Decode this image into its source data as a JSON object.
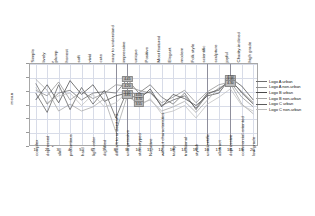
{
  "chart_data": {
    "type": "line",
    "title": "",
    "xlabel": "",
    "ylabel": "mean",
    "ylim": [
      2,
      5
    ],
    "yticks": [
      "2",
      "2.5",
      "3",
      "3.5",
      "4",
      "4.5",
      "5"
    ],
    "grid": true,
    "legend_position": "right",
    "categories": [
      "Simple",
      "lively",
      "plump",
      "honest",
      "soft",
      "vivid",
      "cute",
      "easy to understand",
      "impressive",
      "unique",
      "Positive",
      "Most featured",
      "Elegant",
      "modern",
      "Folk style",
      "scientific",
      "sculpture",
      "joyful",
      "Charity-inclined",
      "high grade"
    ],
    "bottom_categories": [
      "complex",
      "depressed",
      "slim",
      "pretentious",
      "hard",
      "light color",
      "dignified",
      "difficult to understand",
      "unimpressive",
      "stereotyped",
      "Negative",
      "without characteristics",
      "tacky",
      "traditional",
      "stylish",
      "unscientific",
      "abstract",
      "depressive",
      "commercial-oriented",
      "low grade"
    ],
    "bottom_indices": [
      "1",
      "2",
      "3",
      "4",
      "5",
      "6",
      "7",
      "8",
      "9",
      "10",
      "11",
      "12",
      "13",
      "14",
      "15",
      "16",
      "17",
      "18",
      "19",
      "20"
    ],
    "series": [
      {
        "name": "Logo A urban",
        "color": "#6e6e6e",
        "values": [
          4.3,
          3.55,
          3.95,
          4.05,
          3.7,
          3.95,
          4.0,
          3.95,
          4.45,
          3.95,
          4.25,
          3.8,
          3.55,
          3.95,
          3.35,
          3.9,
          4.1,
          4.4,
          4.0,
          3.6
        ]
      },
      {
        "name": "Logo A non-urban",
        "color": "#8f8f8f",
        "values": [
          4.05,
          3.85,
          4.35,
          3.7,
          4.0,
          3.75,
          3.95,
          4.25,
          4.2,
          4.05,
          3.95,
          3.6,
          3.8,
          4.05,
          3.6,
          4.0,
          4.25,
          4.35,
          3.8,
          3.45
        ]
      },
      {
        "name": "Logo B urban",
        "color": "#4a4a4a",
        "values": [
          3.7,
          4.25,
          3.6,
          4.4,
          3.9,
          4.25,
          3.65,
          3.85,
          3.95,
          3.7,
          4.1,
          3.45,
          3.9,
          3.75,
          3.5,
          3.85,
          3.95,
          4.5,
          4.2,
          3.7
        ]
      },
      {
        "name": "Logo B non-urban",
        "color": "#a6a6a6",
        "values": [
          4.45,
          4.05,
          3.3,
          3.55,
          3.3,
          3.45,
          3.75,
          2.55,
          3.85,
          3.55,
          3.7,
          3.3,
          3.45,
          3.65,
          3.25,
          3.7,
          4.15,
          4.3,
          3.55,
          3.2
        ]
      },
      {
        "name": "Logo C urban",
        "color": "#5c5c5c",
        "values": [
          3.95,
          3.25,
          4.25,
          3.35,
          4.15,
          3.55,
          4.05,
          3.05,
          4.05,
          3.85,
          4.0,
          3.5,
          3.7,
          3.85,
          3.4,
          3.95,
          4.05,
          4.45,
          3.95,
          3.55
        ]
      },
      {
        "name": "Logo C non-urban",
        "color": "#bdbdbd",
        "values": [
          4.15,
          3.6,
          3.85,
          3.95,
          3.5,
          3.9,
          3.45,
          3.6,
          4.0,
          3.45,
          3.75,
          3.2,
          3.3,
          3.5,
          3.05,
          3.55,
          3.8,
          4.1,
          3.5,
          3.3
        ]
      }
    ],
    "value_labels": [
      {
        "x_index": 8,
        "value": "4.45",
        "series": "Logo A urban"
      },
      {
        "x_index": 8,
        "value": "4.20",
        "series": "Logo A non-urban"
      },
      {
        "x_index": 8,
        "value": "3.95",
        "series": "Logo B urban"
      },
      {
        "x_index": 8,
        "value": "3.85",
        "series": "Logo B non-urban"
      },
      {
        "x_index": 9,
        "value": "4.05",
        "series": "Logo C urban"
      },
      {
        "x_index": 9,
        "value": "3.70",
        "series": "Logo B urban"
      },
      {
        "x_index": 9,
        "value": "3.55",
        "series": "Logo B non-urban"
      },
      {
        "x_index": 17,
        "value": "4.50",
        "series": "Logo B urban"
      },
      {
        "x_index": 17,
        "value": "4.40",
        "series": "Logo A urban"
      },
      {
        "x_index": 17,
        "value": "4.30",
        "series": "Logo B non-urban"
      }
    ]
  },
  "legend": {
    "entries": [
      "Logo A urban",
      "Logo A non-urban",
      "Logo B urban",
      "Logo B non-urban",
      "Logo C urban",
      "Logo C non-urban"
    ]
  }
}
